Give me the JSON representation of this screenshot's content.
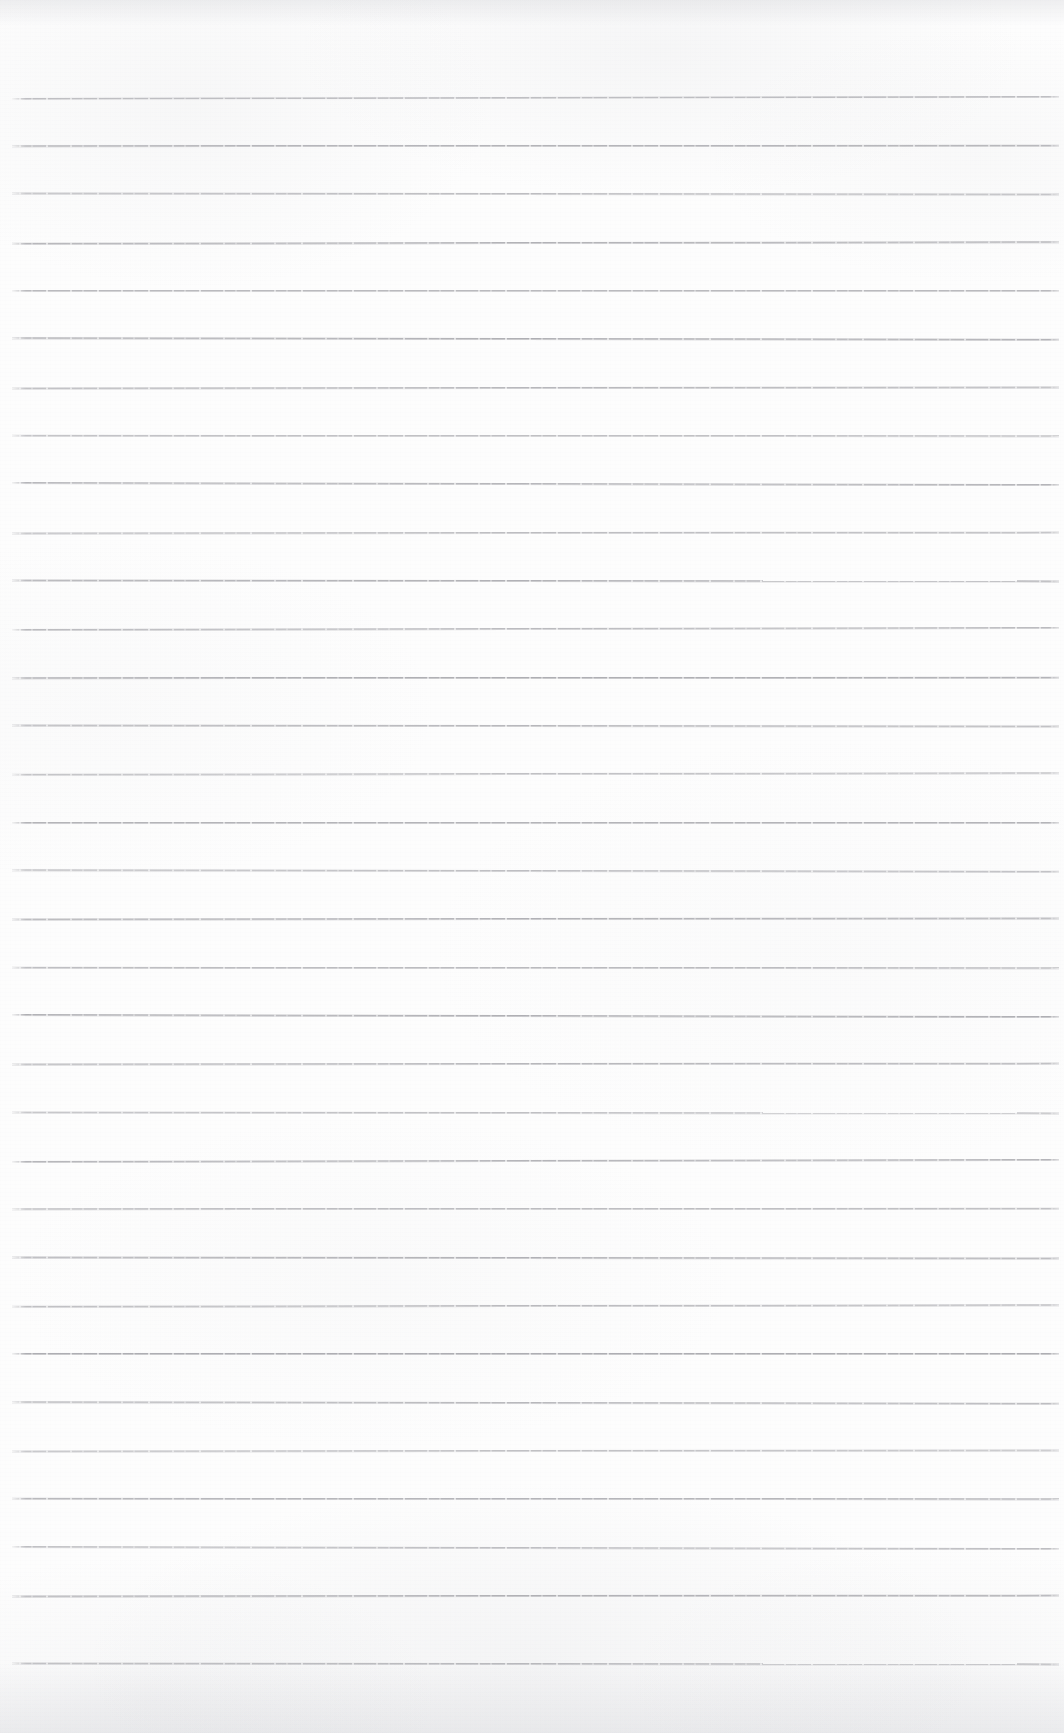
{
  "document": {
    "kind": "scanned-lined-notebook-page",
    "title": "Blank Ruled Notebook Page",
    "page_text": "",
    "handwriting": "",
    "printed_text": "",
    "annotations": []
  },
  "canvas": {
    "width": 1064,
    "height": 1733,
    "paper_color": "#fdfdfd",
    "background_color": "#ffffff"
  },
  "ruling": {
    "line_color": "#a9a9ae",
    "line_thickness_px": 1,
    "line_spacing_px": 48.3,
    "first_line_y_px": 97,
    "last_line_y_px": 1663,
    "line_start_x_px": 12,
    "line_end_x_px": 1059,
    "line_count": 33,
    "top_margin_px": 97,
    "bottom_margin_px": 70,
    "left_margin_rule": false,
    "lines_y": [
      97,
      145,
      193,
      242,
      290,
      338,
      387,
      435,
      483,
      532,
      580,
      628,
      677,
      725,
      773,
      822,
      870,
      918,
      967,
      1015,
      1063,
      1112,
      1160,
      1208,
      1257,
      1305,
      1353,
      1402,
      1450,
      1498,
      1547,
      1595,
      1663
    ]
  },
  "scan": {
    "edge_shadow_top": true,
    "edge_shadow_bottom": true,
    "texture": "faint-gray-mottling"
  }
}
